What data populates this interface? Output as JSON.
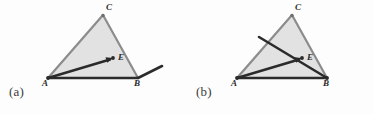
{
  "figure": {
    "width": 374,
    "height": 114,
    "background": "#fdfdfd",
    "type": "geometry-diagram"
  },
  "style": {
    "triangle_fill": "#e0e0e0",
    "triangle_stroke": "#8c8c8c",
    "dark_stroke": "#2b2b2b",
    "label_color": "#2b2b2b",
    "caption_color": "#3b3b3b"
  },
  "panels": [
    {
      "id": "a",
      "caption": "(a)",
      "vertices": {
        "A": {
          "x": 48,
          "y": 78,
          "label": "A",
          "label_x": 43,
          "label_y": 84
        },
        "B": {
          "x": 138,
          "y": 78,
          "label": "B",
          "label_x": 135,
          "label_y": 84
        },
        "C": {
          "x": 103,
          "y": 15,
          "label": "C",
          "label_x": 107,
          "label_y": 4
        },
        "E": {
          "x": 113,
          "y": 58,
          "label": "E",
          "label_x": 118,
          "label_y": 58
        }
      },
      "segments": [
        {
          "name": "base-AB",
          "from": "A",
          "to": "B",
          "x1": 48,
          "y1": 78,
          "x2": 138,
          "y2": 78,
          "width": 2.6
        },
        {
          "name": "arrow-A-to-E",
          "from": "A",
          "to": "E",
          "x1": 48,
          "y1": 78,
          "x2": 112,
          "y2": 59,
          "width": 2.4
        },
        {
          "name": "ray-from-B",
          "from": "B",
          "to": "outside",
          "x1": 138,
          "y1": 78,
          "x2": 162,
          "y2": 66,
          "width": 2.4
        }
      ]
    },
    {
      "id": "b",
      "caption": "(b)",
      "vertices": {
        "A": {
          "x": 237,
          "y": 78,
          "label": "A",
          "label_x": 232,
          "label_y": 84
        },
        "B": {
          "x": 327,
          "y": 78,
          "label": "B",
          "label_x": 324,
          "label_y": 84
        },
        "C": {
          "x": 292,
          "y": 15,
          "label": "C",
          "label_x": 296,
          "label_y": 4
        },
        "E": {
          "x": 302,
          "y": 58,
          "label": "E",
          "label_x": 307,
          "label_y": 58
        }
      },
      "segments": [
        {
          "name": "base-AB",
          "from": "A",
          "to": "B",
          "x1": 237,
          "y1": 78,
          "x2": 327,
          "y2": 78,
          "width": 2.6
        },
        {
          "name": "arrow-A-to-E",
          "from": "A",
          "to": "E",
          "x1": 237,
          "y1": 78,
          "x2": 301,
          "y2": 59,
          "width": 2.4
        },
        {
          "name": "crossing-line",
          "from": "outside",
          "to": "B",
          "x1": 259,
          "y1": 37,
          "x2": 327,
          "y2": 78,
          "width": 2.4
        }
      ]
    }
  ]
}
